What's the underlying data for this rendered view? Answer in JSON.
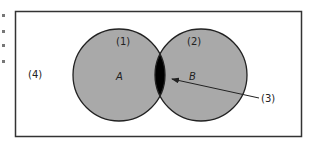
{
  "diagram": {
    "type": "venn",
    "colors": {
      "background": "#ffffff",
      "frame": "#333333",
      "set_fill": "#a9a9a9",
      "intersection_fill": "#000000",
      "outline": "#222222"
    },
    "regions": {
      "universe": {
        "label": "(4)"
      },
      "set_a": {
        "number_label": "(1)",
        "letter_label": "A"
      },
      "set_b": {
        "number_label": "(2)",
        "letter_label": "B"
      },
      "intersection": {
        "label": "(3)"
      }
    }
  }
}
